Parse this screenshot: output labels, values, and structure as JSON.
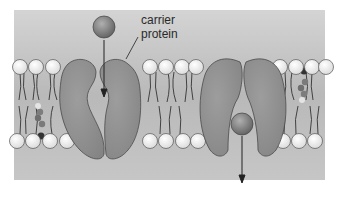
{
  "diagram": {
    "labels": {
      "carrier_line1": "carrier",
      "carrier_line2": "protein"
    },
    "colors": {
      "background_top": "#c9c9c9",
      "background_bottom": "#b5b5b5",
      "protein": "#8f8f8f",
      "protein_stroke": "#555555",
      "lipid_head": "#f2f2f2",
      "solute": "#8a8a8a",
      "arrow": "#222222"
    },
    "components": [
      "lipid bilayer",
      "carrier protein (open to outside)",
      "carrier protein (open to inside)",
      "solute molecule",
      "cholesterol"
    ]
  }
}
